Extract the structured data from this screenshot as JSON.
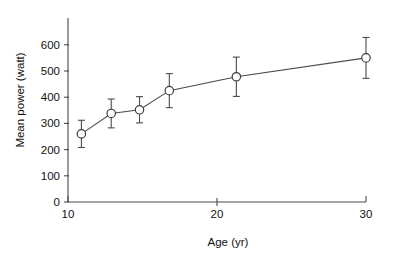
{
  "chart_data": {
    "type": "scatter",
    "title": "",
    "subtitle": "",
    "xlabel": "Age (yr)",
    "ylabel": "Mean power (watt)",
    "xlim": [
      10,
      30
    ],
    "ylim": [
      0,
      630
    ],
    "grid": false,
    "legend": null,
    "marker_style": "open-circle",
    "line_connecting_points": true,
    "error_bars": "vertical, caps at both ends",
    "x_ticks": [
      10,
      20,
      30
    ],
    "x_tick_labels": [
      "10",
      "20",
      "30"
    ],
    "y_ticks": [
      0,
      100,
      200,
      300,
      400,
      500,
      600
    ],
    "y_tick_labels": [
      "0",
      "100",
      "200",
      "300",
      "400",
      "500",
      "600"
    ],
    "x": [
      10.9,
      12.9,
      14.8,
      16.8,
      21.3,
      30.0
    ],
    "values": [
      260,
      338,
      352,
      425,
      478,
      550
    ],
    "error_low": [
      208,
      283,
      302,
      360,
      403,
      472
    ],
    "error_high": [
      312,
      393,
      402,
      490,
      553,
      628
    ],
    "points": [
      {
        "age": 10.9,
        "mean_power": 260,
        "low": 208,
        "high": 312
      },
      {
        "age": 12.9,
        "mean_power": 338,
        "low": 283,
        "high": 393
      },
      {
        "age": 14.8,
        "mean_power": 352,
        "low": 302,
        "high": 402
      },
      {
        "age": 16.8,
        "mean_power": 425,
        "low": 360,
        "high": 490
      },
      {
        "age": 21.3,
        "mean_power": 478,
        "low": 403,
        "high": 553
      },
      {
        "age": 30.0,
        "mean_power": 550,
        "low": 472,
        "high": 628
      }
    ],
    "colors": {
      "axis": "#4a4a4a",
      "line": "#4a4a4a",
      "marker_fill": "#ffffff",
      "marker_stroke": "#3d3d3d",
      "text": "#111111",
      "background": "#ffffff"
    }
  }
}
